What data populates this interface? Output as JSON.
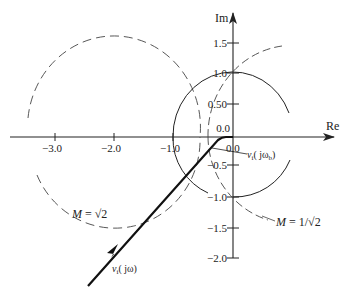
{
  "diagram": {
    "axes": {
      "x_label": "Re",
      "y_label": "Im",
      "x_ticks": [
        "−3.0",
        "−2.0",
        "−1.0",
        "0.0"
      ],
      "y_ticks_pos": [
        "1.5",
        "1.0",
        "0.50",
        "0.0"
      ],
      "y_ticks_neg": [
        "−0.5",
        "−1.0",
        "−1.5",
        "−2.0"
      ]
    },
    "annotations": {
      "m_sqrt2": "M = √2",
      "m_inv_sqrt2": "M = 1/√2",
      "locus": "vᵢ( jω)",
      "locus_b": "vᵢ( jωᵦ)"
    },
    "labels": {
      "locus_v": "v",
      "locus_sub": "i",
      "locus_arg": "( jω)",
      "locus_b_arg_pre": "( jω",
      "locus_b_sub": "b",
      "locus_b_arg_post": ")",
      "m1_pre": "M",
      "m1_post": " = √2",
      "m2_pre": "M",
      "m2_post": " = 1/√2"
    },
    "curves": [
      {
        "name": "M = √2 circle",
        "style": "dashed",
        "center": [
          -2.0,
          0.0
        ],
        "radius": 1.414
      },
      {
        "name": "unit circle (M-circle reference)",
        "style": "solid",
        "center": [
          0.0,
          0.0
        ],
        "radius": 1.0
      },
      {
        "name": "M = 1/√2 circle",
        "style": "dashed",
        "center": [
          1.0,
          0.0
        ],
        "radius": 1.414
      },
      {
        "name": "v_i(jω) locus",
        "style": "thick solid with arrow"
      }
    ],
    "colors": {
      "stroke": "#222222",
      "dashed": "#444444",
      "background": "#ffffff"
    }
  }
}
